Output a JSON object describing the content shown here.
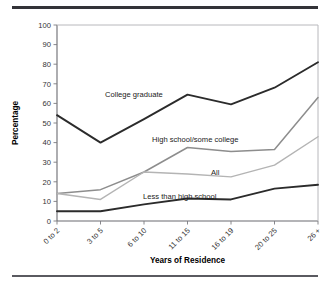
{
  "figure": {
    "top_rule": "",
    "bottom_rule": ""
  },
  "axes": {
    "ylabel": "Percentage",
    "xlabel": "Years of Residence",
    "yticks": [
      "0",
      "10",
      "20",
      "30",
      "40",
      "50",
      "60",
      "70",
      "80",
      "90",
      "100"
    ],
    "xticks": [
      "0 to 2",
      "3 to 5",
      "6 to 10",
      "11 to 15",
      "16 to 19",
      "20 to 25",
      "26 +"
    ]
  },
  "series_labels": {
    "college": "College graduate",
    "highschool": "High school/some college",
    "all": "All",
    "lessthan": "Less than high school"
  },
  "colors": {
    "college": "#2b2b2b",
    "highschool": "#8d8d8d",
    "all": "#b4b4b4",
    "lessthan": "#2b2b2b",
    "axis": "#6b6b70",
    "text": "#333333"
  },
  "chart_data": {
    "type": "line",
    "title": "",
    "xlabel": "Years of Residence",
    "ylabel": "Percentage",
    "ylim": [
      0,
      100
    ],
    "ytick_step": 10,
    "grid": false,
    "legend_position": "inline-annotations",
    "categories": [
      "0 to 2",
      "3 to 5",
      "6 to 10",
      "11 to 15",
      "16 to 19",
      "20 to 25",
      "26 +"
    ],
    "series": [
      {
        "name": "College graduate",
        "color": "#2b2b2b",
        "values": [
          54,
          40,
          52,
          64.5,
          59.5,
          68,
          81
        ]
      },
      {
        "name": "High school/some college",
        "color": "#8d8d8d",
        "values": [
          14,
          16,
          25,
          37.5,
          35.5,
          36.5,
          63
        ]
      },
      {
        "name": "All",
        "color": "#b4b4b4",
        "values": [
          14,
          11,
          25,
          24,
          22.5,
          28.5,
          43
        ]
      },
      {
        "name": "Less than high school",
        "color": "#2b2b2b",
        "values": [
          5,
          5,
          8.5,
          11.5,
          11,
          16.5,
          18.5
        ]
      }
    ]
  }
}
